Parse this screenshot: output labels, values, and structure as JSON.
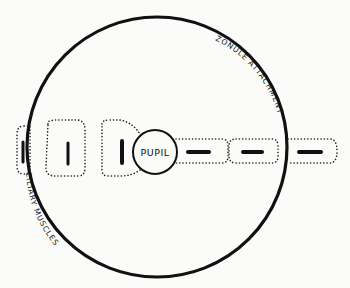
{
  "diagram": {
    "type": "schematic",
    "colors": {
      "ink": "#111111",
      "background": "#fbfbfa"
    },
    "labels": {
      "pupil": "PUPIL",
      "zonule": "ZONULE ATTACHMENT",
      "ciliary": "CILIARY MUSCLES"
    },
    "muscle_segments": [
      {
        "id": "left-outer",
        "orientation": "vertical"
      },
      {
        "id": "left-middle",
        "orientation": "vertical"
      },
      {
        "id": "left-inner",
        "orientation": "vertical"
      },
      {
        "id": "right-inner",
        "orientation": "horizontal"
      },
      {
        "id": "right-middle",
        "orientation": "horizontal"
      },
      {
        "id": "right-outer",
        "orientation": "horizontal"
      }
    ]
  }
}
